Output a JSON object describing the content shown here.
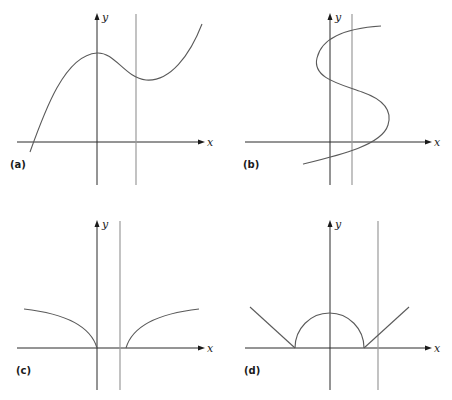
{
  "figure": {
    "axis_labels": {
      "x": "x",
      "y": "y"
    },
    "panels": [
      {
        "id": "a",
        "label": "(a)",
        "curve": "cubic-like curve with local max on y-axis and local min right of it",
        "vertical_line_crossings": 1
      },
      {
        "id": "b",
        "label": "(b)",
        "curve": "S-shaped curve (x as a function of y)",
        "vertical_line_crossings": 3
      },
      {
        "id": "c",
        "label": "(c)",
        "curve": "two square-root branches meeting x-axis with a gap",
        "vertical_line_crossings": 0
      },
      {
        "id": "d",
        "label": "(d)",
        "curve": "linear rays joined by a semicircle arch",
        "vertical_line_crossings": 1
      }
    ]
  },
  "colors": {
    "axis": "#2a2a2a",
    "curve": "#5a5a5a",
    "vertical_line": "#9a9a9a",
    "background": "#ffffff"
  }
}
